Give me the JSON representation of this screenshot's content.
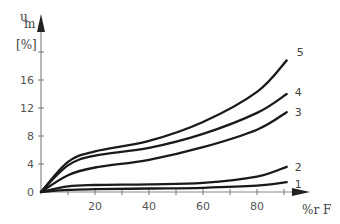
{
  "chart_data": {
    "type": "line",
    "title": "",
    "ylabel": "u_m [%]",
    "ylabel_main": "u",
    "ylabel_sub": "m",
    "ylabel_unit": "[%]",
    "xlabel": "%r F",
    "xlim": [
      0,
      100
    ],
    "ylim": [
      0,
      22
    ],
    "xticks": [
      20,
      40,
      60,
      80
    ],
    "yticks": [
      0,
      4,
      8,
      12,
      16
    ],
    "grid": false,
    "legend": "inline curve labels at right end",
    "series": [
      {
        "name": "1",
        "x": [
          0,
          10,
          20,
          40,
          60,
          80,
          91
        ],
        "y": [
          0,
          0.3,
          0.4,
          0.5,
          0.6,
          0.9,
          1.4
        ]
      },
      {
        "name": "2",
        "x": [
          0,
          10,
          20,
          40,
          60,
          80,
          91
        ],
        "y": [
          0,
          0.8,
          1.0,
          1.1,
          1.3,
          2.2,
          3.6
        ]
      },
      {
        "name": "3",
        "x": [
          0,
          10,
          20,
          40,
          60,
          80,
          91
        ],
        "y": [
          0,
          2.4,
          3.5,
          4.6,
          6.4,
          8.9,
          11.4
        ]
      },
      {
        "name": "4",
        "x": [
          0,
          10,
          20,
          40,
          60,
          80,
          91
        ],
        "y": [
          0,
          3.8,
          5.2,
          6.3,
          8.3,
          11.3,
          14.0
        ]
      },
      {
        "name": "5",
        "x": [
          0,
          10,
          20,
          40,
          60,
          80,
          91
        ],
        "y": [
          0,
          4.3,
          5.8,
          7.3,
          10.0,
          14.3,
          18.8
        ]
      }
    ]
  }
}
